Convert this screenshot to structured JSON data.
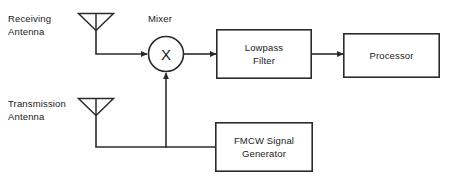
{
  "diagram": {
    "type": "block-diagram",
    "canvas": {
      "width": 456,
      "height": 178
    },
    "colors": {
      "background": "#ffffff",
      "stroke": "#2b2b2b",
      "text": "#1a1a1a"
    },
    "labels": {
      "receiving_antenna": "Receiving\nAntenna",
      "transmission_antenna": "Transmission\nAntenna",
      "mixer": "Mixer"
    },
    "nodes": {
      "receiving_antenna": {
        "name": "Receiving Antenna",
        "shape": "antenna",
        "x": 96,
        "y": 22
      },
      "transmission_antenna": {
        "name": "Transmission Antenna",
        "shape": "antenna",
        "x": 96,
        "y": 107
      },
      "mixer": {
        "name": "Mixer",
        "shape": "circle",
        "symbol": "X",
        "cx": 166,
        "cy": 54,
        "r": 18
      },
      "lowpass_filter": {
        "name": "Lowpass Filter",
        "shape": "rect",
        "label": "Lowpass\nFilter",
        "x": 216,
        "y": 29,
        "width": 96,
        "height": 50
      },
      "processor": {
        "name": "Processor",
        "shape": "rect",
        "label": "Processor",
        "x": 343,
        "y": 33,
        "width": 97,
        "height": 45
      },
      "fmcw_generator": {
        "name": "FMCW Signal Generator",
        "shape": "rect",
        "label": "FMCW Signal\nGenerator",
        "x": 215,
        "y": 122,
        "width": 98,
        "height": 50
      }
    },
    "connections": [
      {
        "name": "rx-antenna-to-mixer",
        "from": "receiving_antenna",
        "to": "mixer",
        "arrow": true
      },
      {
        "name": "mixer-to-lowpass-filter",
        "from": "mixer",
        "to": "lowpass_filter",
        "arrow": true
      },
      {
        "name": "lowpass-filter-to-processor",
        "from": "lowpass_filter",
        "to": "processor",
        "arrow": true
      },
      {
        "name": "fmcw-generator-to-bus",
        "from": "fmcw_generator",
        "to": "signal_bus",
        "arrow": false
      },
      {
        "name": "bus-to-mixer",
        "from": "signal_bus",
        "to": "mixer",
        "arrow": true
      },
      {
        "name": "bus-to-tx-antenna",
        "from": "signal_bus",
        "to": "transmission_antenna",
        "arrow": false
      }
    ]
  }
}
